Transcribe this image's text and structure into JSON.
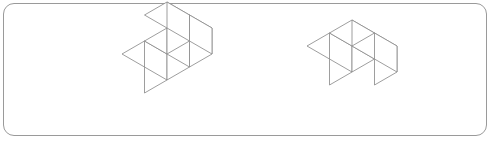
{
  "image": {
    "width": 493,
    "height": 143,
    "background_color": "#ffffff",
    "kind": "isometric-cube-puzzle-illustration"
  },
  "panel": {
    "name": "rounded-rectangle-frame",
    "border_color": "#9a9a9a",
    "border_width_px": 1,
    "corner_radius_px": 11,
    "fill_color": "#ffffff",
    "x": 3,
    "y": 3,
    "width": 484,
    "height": 133
  },
  "style": {
    "line_color": "#8d8d8d",
    "line_width_px": 0.85,
    "face_fill": "#ffffff"
  },
  "figures": [
    {
      "id": "figure-left",
      "label": "",
      "cube_count": 4,
      "description": "Row of three unit cubes extending to the right, with a fourth cube stacked on top of the second cube from the right end.",
      "origin_px": {
        "x": 122,
        "y": 80
      },
      "cube_size_px": 26,
      "iso": {
        "dx": 22.5,
        "dy": 13.0,
        "dz": 26.0
      },
      "cells": [
        {
          "x": 0,
          "y": 0,
          "z": 0
        },
        {
          "x": 1,
          "y": 0,
          "z": 0
        },
        {
          "x": 2,
          "y": 0,
          "z": 0
        },
        {
          "x": 1,
          "y": 0,
          "z": 1
        }
      ]
    },
    {
      "id": "figure-right",
      "label": "",
      "cube_count": 3,
      "description": "Corner arrangement: two cubes side by side with a third cube stacked forming an L seen from above.",
      "origin_px": {
        "x": 307,
        "y": 72
      },
      "cube_size_px": 26,
      "iso": {
        "dx": 22.5,
        "dy": 13.0,
        "dz": 26.0
      },
      "cells": [
        {
          "x": 0,
          "y": 0,
          "z": 0
        },
        {
          "x": 1,
          "y": 0,
          "z": 0
        },
        {
          "x": 1,
          "y": 1,
          "z": 0
        }
      ]
    }
  ]
}
